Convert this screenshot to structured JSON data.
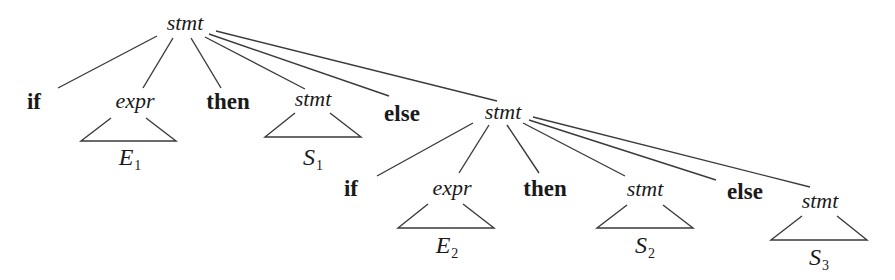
{
  "diagram": {
    "type": "parse-tree",
    "colors": {
      "line": "#3a3a3a",
      "text": "#1a1a1a",
      "background": "#ffffff"
    },
    "root": {
      "label": "stmt",
      "children": [
        {
          "label": "if",
          "kind": "terminal"
        },
        {
          "label": "expr",
          "kind": "nonterminal",
          "subtree": {
            "base": "E",
            "index": "1"
          }
        },
        {
          "label": "then",
          "kind": "terminal"
        },
        {
          "label": "stmt",
          "kind": "nonterminal",
          "subtree": {
            "base": "S",
            "index": "1"
          }
        },
        {
          "label": "else",
          "kind": "terminal"
        },
        {
          "label": "stmt",
          "kind": "nonterminal",
          "children": [
            {
              "label": "if",
              "kind": "terminal"
            },
            {
              "label": "expr",
              "kind": "nonterminal",
              "subtree": {
                "base": "E",
                "index": "2"
              }
            },
            {
              "label": "then",
              "kind": "terminal"
            },
            {
              "label": "stmt",
              "kind": "nonterminal",
              "subtree": {
                "base": "S",
                "index": "2"
              }
            },
            {
              "label": "else",
              "kind": "terminal"
            },
            {
              "label": "stmt",
              "kind": "nonterminal",
              "subtree": {
                "base": "S",
                "index": "3"
              }
            }
          ]
        }
      ]
    }
  }
}
